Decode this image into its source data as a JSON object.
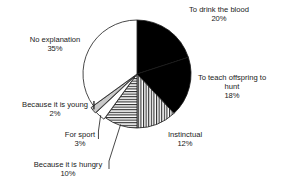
{
  "chart_data": {
    "type": "pie",
    "title": "",
    "subtitle": "",
    "xlabel": "",
    "ylabel": "",
    "legend_position": "none",
    "grid": false,
    "labels_show_percent": true,
    "total": 100,
    "categories": [
      "To drink the blood",
      "To teach offspring to hunt",
      "Instinctual",
      "Because it is hungry",
      "For sport",
      "Because it is young",
      "No explanation"
    ],
    "values": [
      20,
      18,
      12,
      10,
      3,
      2,
      35
    ],
    "slices": [
      {
        "label": "To drink the blood",
        "value": 20,
        "percent_text": "20%",
        "fill": "#000000",
        "pattern": "solid",
        "label_lines": [
          "To drink the blood",
          "20%"
        ],
        "label_anchor": "middle",
        "label_x": 219,
        "label_y": 12,
        "leader": false
      },
      {
        "label": "To teach offspring to hunt",
        "value": 18,
        "percent_text": "18%",
        "fill": "#000000",
        "pattern": "solid",
        "label_lines": [
          "To teach offspring to",
          "hunt",
          "18%"
        ],
        "label_anchor": "middle",
        "label_x": 232,
        "label_y": 80,
        "leader": false
      },
      {
        "label": "Instinctual",
        "value": 12,
        "percent_text": "12%",
        "fill": "#ffffff",
        "pattern": "vertical-stripes",
        "label_lines": [
          "Instinctual",
          "12%"
        ],
        "label_anchor": "middle",
        "label_x": 185,
        "label_y": 137,
        "leader": false
      },
      {
        "label": "Because it is hungry",
        "value": 10,
        "percent_text": "10%",
        "fill": "#ffffff",
        "pattern": "horizontal-stripes",
        "label_lines": [
          "Because it is hungry",
          "10%"
        ],
        "label_anchor": "middle",
        "label_x": 68,
        "label_y": 167,
        "leader": true
      },
      {
        "label": "For sport",
        "value": 3,
        "percent_text": "3%",
        "fill": "#ffffff",
        "pattern": "solid",
        "label_lines": [
          "For sport",
          "3%"
        ],
        "label_anchor": "middle",
        "label_x": 80,
        "label_y": 137,
        "leader": true
      },
      {
        "label": "Because it is young",
        "value": 2,
        "percent_text": "2%",
        "fill": "#c9c9c9",
        "pattern": "solid",
        "label_lines": [
          "Because it is young",
          "2%"
        ],
        "label_anchor": "middle",
        "label_x": 55,
        "label_y": 107,
        "leader": true
      },
      {
        "label": "No explanation",
        "value": 35,
        "percent_text": "35%",
        "fill": "#ffffff",
        "pattern": "solid",
        "label_lines": [
          "No explanation",
          "35%"
        ],
        "label_anchor": "middle",
        "label_x": 55,
        "label_y": 42,
        "leader": false
      }
    ],
    "geometry": {
      "center_x": 137,
      "center_y": 74,
      "radius": 54,
      "start_angle_deg": 0,
      "direction": "clockwise"
    },
    "colors": {
      "stroke": "#1a1a1a",
      "text": "#1a1a1a",
      "black_slice": "#000000",
      "gray_slice": "#c9c9c9",
      "white_slice": "#ffffff",
      "background": "#ffffff"
    }
  }
}
